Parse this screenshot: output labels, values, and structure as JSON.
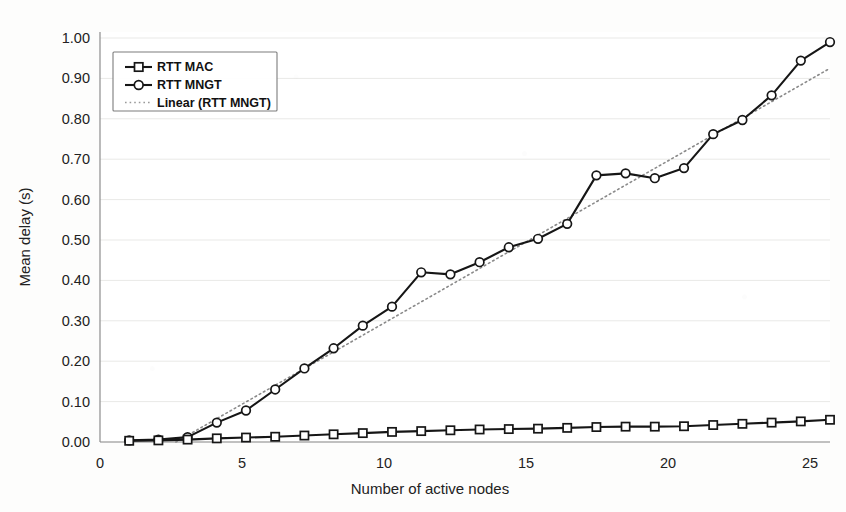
{
  "chart_data": {
    "type": "line",
    "title": "",
    "xlabel": "Number of active nodes",
    "ylabel": "Mean delay (s)",
    "xlim": [
      0,
      25
    ],
    "ylim": [
      0.0,
      1.0
    ],
    "xticks": [
      0,
      5,
      10,
      15,
      20,
      25
    ],
    "xtick_labels": [
      "0",
      "5",
      "10",
      "15",
      "20",
      "25"
    ],
    "yticks": [
      0.0,
      0.1,
      0.2,
      0.3,
      0.4,
      0.5,
      0.6,
      0.7,
      0.8,
      0.9,
      1.0
    ],
    "ytick_labels": [
      "0.00",
      "0.10",
      "0.20",
      "0.30",
      "0.40",
      "0.50",
      "0.60",
      "0.70",
      "0.80",
      "0.90",
      "1.00"
    ],
    "grid": true,
    "grid_axis": "y",
    "legend_position": "upper left",
    "x": [
      1,
      2,
      3,
      4,
      5,
      6,
      7,
      8,
      9,
      10,
      11,
      12,
      13,
      14,
      15,
      16,
      17,
      18,
      19,
      20,
      21,
      22,
      23,
      24,
      25
    ],
    "series": [
      {
        "name": "RTT MAC",
        "marker": "square",
        "style": "solid",
        "color": "#161616",
        "values": [
          0.003,
          0.004,
          0.006,
          0.009,
          0.011,
          0.013,
          0.016,
          0.019,
          0.022,
          0.025,
          0.027,
          0.029,
          0.031,
          0.032,
          0.033,
          0.035,
          0.037,
          0.038,
          0.038,
          0.039,
          0.042,
          0.045,
          0.048,
          0.051,
          0.055
        ]
      },
      {
        "name": "RTT MNGT",
        "marker": "circle",
        "style": "solid",
        "color": "#161616",
        "values": [
          0.004,
          0.006,
          0.012,
          0.048,
          0.078,
          0.13,
          0.182,
          0.232,
          0.288,
          0.335,
          0.42,
          0.415,
          0.445,
          0.482,
          0.503,
          0.54,
          0.66,
          0.665,
          0.653,
          0.678,
          0.762,
          0.797,
          0.858,
          0.944,
          0.99
        ]
      },
      {
        "name": "Linear (RTT MNGT)",
        "marker": "none",
        "style": "dotted",
        "color": "#8a8a8a",
        "trend_x": [
          2.6,
          25.0
        ],
        "trend_y": [
          0.0,
          0.925
        ]
      }
    ],
    "legend": [
      "RTT MAC",
      "RTT MNGT",
      "Linear (RTT MNGT)"
    ]
  },
  "colors": {
    "background": "#fdfdfc",
    "series_line": "#161616",
    "trend_line": "#8a8a8a",
    "grid": "#e9e9e7",
    "axis": "#8d8d8d",
    "text": "#222222"
  }
}
